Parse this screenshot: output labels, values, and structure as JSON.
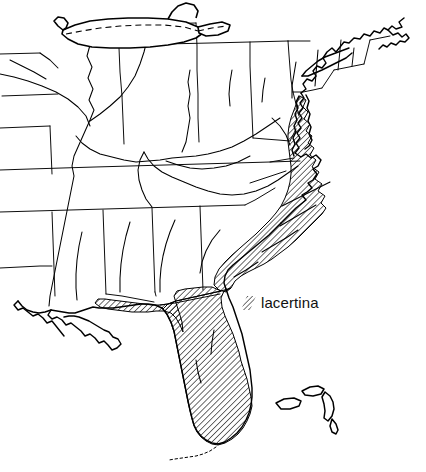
{
  "figure": {
    "type": "distribution-map",
    "region": "Eastern United States",
    "background_color": "#ffffff",
    "ink_color": "#000000",
    "style": "pen-and-ink line drawing"
  },
  "legend": {
    "entries": [
      {
        "label": "lacertina",
        "swatch": "diagonal-hatch",
        "hatch_angle_degrees": 45,
        "hatch_spacing_px": 3
      }
    ]
  },
  "map_elements": {
    "coastline_name": "atlantic-gulf-coastline",
    "state_borders_name": "state-borders",
    "rivers_name": "river-network",
    "lake_name": "great-lakes",
    "international_border_name": "dashed-international-border",
    "islands_name": "bahamas-islands",
    "range_name": "lacertina-range-hatched"
  },
  "range_description": {
    "shading": "diagonal-hatch",
    "extent": "Atlantic and Gulf coastal plain from Virginia south through the Carolinas, Georgia, all of Florida, and west along the Gulf to Louisiana"
  }
}
